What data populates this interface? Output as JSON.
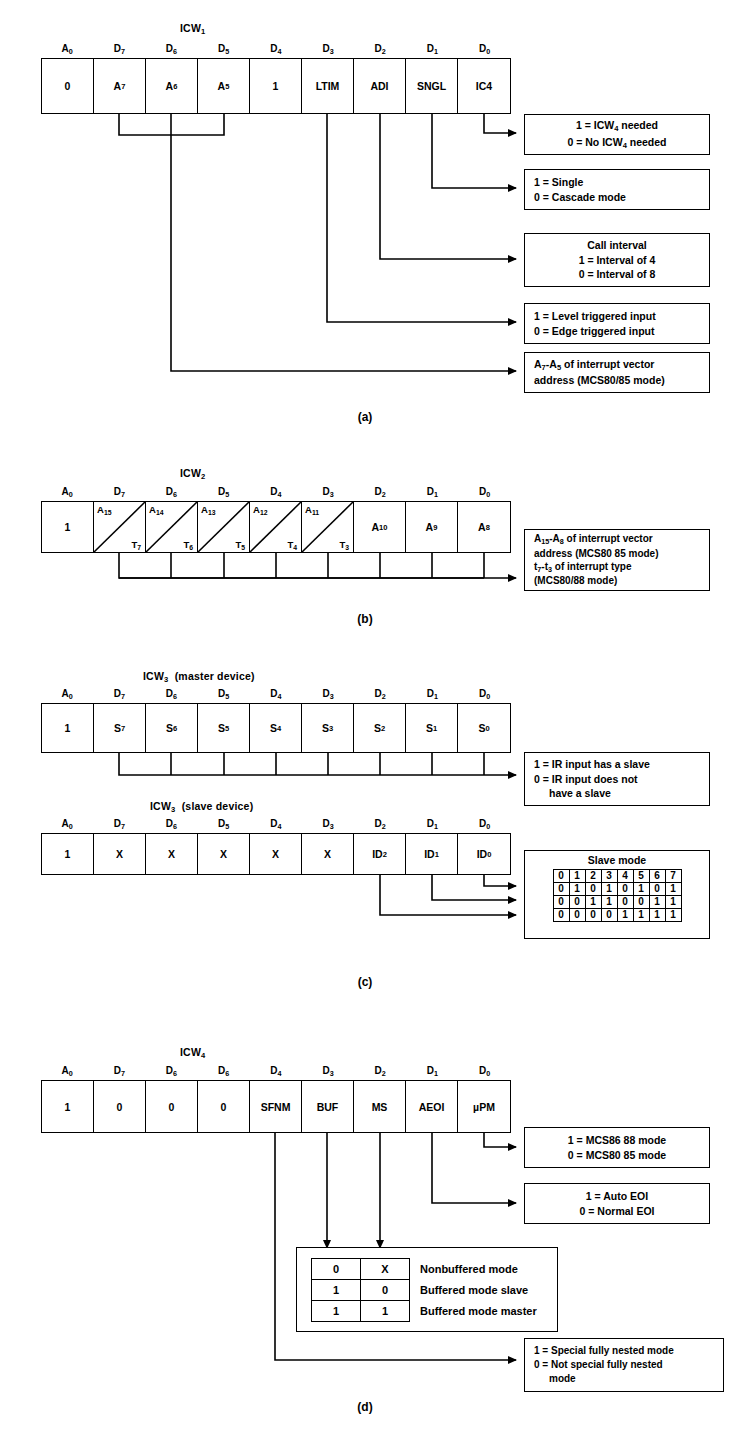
{
  "figure": {
    "sections": [
      {
        "id": "a",
        "label": "(a)",
        "title": "ICW",
        "title_sub": "1",
        "title_suffix": "",
        "pins": [
          "A0",
          "D7",
          "D6",
          "D5",
          "D4",
          "D3",
          "D2",
          "D1",
          "D0"
        ],
        "cells": [
          "0",
          "A7",
          "A6",
          "A5",
          "1",
          "LTIM",
          "ADI",
          "SNGL",
          "IC4"
        ],
        "callouts": [
          {
            "name": "ic4-callout",
            "lines": [
              "1 = ICW4 needed",
              "0 = No ICW4 needed"
            ]
          },
          {
            "name": "sngl-callout",
            "lines": [
              "1 = Single",
              "0 = Cascade mode"
            ]
          },
          {
            "name": "adi-callout",
            "lines": [
              "Call interval",
              "1 = Interval of 4",
              "0 = Interval of 8"
            ]
          },
          {
            "name": "ltim-callout",
            "lines": [
              "1 = Level triggered input",
              "0 = Edge triggered input"
            ]
          },
          {
            "name": "vector-callout",
            "lines": [
              "A7-A5 of interrupt vector",
              "address (MCS80/85 mode)"
            ]
          }
        ]
      },
      {
        "id": "b",
        "label": "(b)",
        "title": "ICW",
        "title_sub": "2",
        "title_suffix": "",
        "pins": [
          "A0",
          "D7",
          "D6",
          "D5",
          "D4",
          "D3",
          "D2",
          "D1",
          "D0"
        ],
        "cells": [
          "1",
          "A15/T7",
          "A14/T6",
          "A13/T5",
          "A12/T4",
          "A11/T3",
          "A10",
          "A9",
          "A8"
        ],
        "callouts": [
          {
            "name": "icw2-callout",
            "lines": [
              "A15-A8 of interrupt vector",
              "address (MCS80 85 mode)",
              "t7-t3 of interrupt type",
              "(MCS80/88 mode)"
            ]
          }
        ]
      },
      {
        "id": "c",
        "label": "(c)",
        "title": "ICW",
        "title_sub": "3",
        "title_suffix": " (master device)",
        "pins": [
          "A0",
          "D7",
          "D6",
          "D5",
          "D4",
          "D3",
          "D2",
          "D1",
          "D0"
        ],
        "cells": [
          "1",
          "S7",
          "S6",
          "S5",
          "S4",
          "S3",
          "S2",
          "S1",
          "S0"
        ],
        "callouts": [
          {
            "name": "master-slave-callout",
            "lines": [
              "1 = IR input has a slave",
              "0 = IR input does not",
              "have a slave"
            ]
          }
        ]
      },
      {
        "id": "c2",
        "label": "",
        "title": "ICW",
        "title_sub": "3",
        "title_suffix": " (slave device)",
        "pins": [
          "A0",
          "D7",
          "D6",
          "D5",
          "D4",
          "D3",
          "D2",
          "D1",
          "D0"
        ],
        "cells": [
          "1",
          "X",
          "X",
          "X",
          "X",
          "X",
          "ID2",
          "ID1",
          "ID0"
        ],
        "callouts": []
      },
      {
        "id": "d",
        "label": "(d)",
        "title": "ICW",
        "title_sub": "4",
        "title_suffix": "",
        "pins": [
          "A0",
          "D7",
          "D6",
          "D6",
          "D4",
          "D3",
          "D2",
          "D1",
          "D0"
        ],
        "cells": [
          "1",
          "0",
          "0",
          "0",
          "SFNM",
          "BUF",
          "MS",
          "AEOI",
          "µPM"
        ],
        "callouts": [
          {
            "name": "upm-callout",
            "lines": [
              "1 = MCS86 88 mode",
              "0 = MCS80 85 mode"
            ]
          },
          {
            "name": "aeoi-callout",
            "lines": [
              "1 = Auto EOI",
              "0 = Normal EOI"
            ]
          },
          {
            "name": "sfnm-callout",
            "lines": [
              "1 = Special fully nested mode",
              "0 = Not special fully nested",
              "mode"
            ]
          }
        ]
      }
    ],
    "slave_mode_table": {
      "caption": "Slave mode",
      "header": [
        "0",
        "1",
        "2",
        "3",
        "4",
        "5",
        "6",
        "7"
      ],
      "rows": [
        [
          "0",
          "1",
          "0",
          "1",
          "0",
          "1",
          "0",
          "1"
        ],
        [
          "0",
          "0",
          "1",
          "1",
          "0",
          "0",
          "1",
          "1"
        ],
        [
          "0",
          "0",
          "0",
          "0",
          "1",
          "1",
          "1",
          "1"
        ]
      ]
    },
    "buffered_mode_table": {
      "rows": [
        {
          "buf": "0",
          "ms": "X",
          "label": "Nonbuffered mode"
        },
        {
          "buf": "1",
          "ms": "0",
          "label": "Buffered mode slave"
        },
        {
          "buf": "1",
          "ms": "1",
          "label": "Buffered mode master"
        }
      ]
    }
  }
}
